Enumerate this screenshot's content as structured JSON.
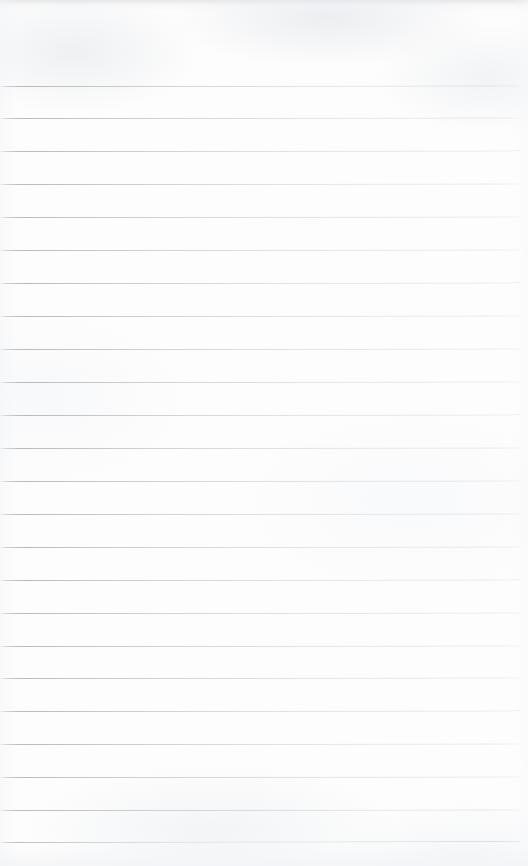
{
  "document": {
    "kind": "blank-ruled-paper-scan",
    "page_width": 528,
    "page_height": 866,
    "page_color": "#fdfdfd",
    "has_text_content": false,
    "has_handwriting": false,
    "has_margin_rule": false,
    "has_header": false,
    "visible_text": ""
  },
  "ruling": {
    "line_color": "#b2b7bd",
    "line_thickness_px": 1,
    "line_count": 24,
    "line_spacing_px": 32.7,
    "first_line_y": 86,
    "last_line_y": 842,
    "line_start_x": 0,
    "line_end_x": 520,
    "right_margin_px": 8,
    "lines": [
      {
        "index": 1,
        "y": 86,
        "x": 0,
        "width": 520,
        "tilt_deg": -0.06
      },
      {
        "index": 2,
        "y": 118,
        "x": 0,
        "width": 520,
        "tilt_deg": -0.05
      },
      {
        "index": 3,
        "y": 151,
        "x": 0,
        "width": 520,
        "tilt_deg": -0.07
      },
      {
        "index": 4,
        "y": 184,
        "x": 0,
        "width": 520,
        "tilt_deg": -0.05
      },
      {
        "index": 5,
        "y": 217,
        "x": 0,
        "width": 520,
        "tilt_deg": -0.06
      },
      {
        "index": 6,
        "y": 250,
        "x": 0,
        "width": 520,
        "tilt_deg": -0.05
      },
      {
        "index": 7,
        "y": 283,
        "x": 0,
        "width": 520,
        "tilt_deg": -0.07
      },
      {
        "index": 8,
        "y": 316,
        "x": 0,
        "width": 520,
        "tilt_deg": -0.05
      },
      {
        "index": 9,
        "y": 349,
        "x": 0,
        "width": 520,
        "tilt_deg": -0.06
      },
      {
        "index": 10,
        "y": 382,
        "x": 0,
        "width": 520,
        "tilt_deg": -0.05
      },
      {
        "index": 11,
        "y": 415,
        "x": 0,
        "width": 520,
        "tilt_deg": -0.07
      },
      {
        "index": 12,
        "y": 448,
        "x": 0,
        "width": 520,
        "tilt_deg": -0.06
      },
      {
        "index": 13,
        "y": 481,
        "x": 0,
        "width": 520,
        "tilt_deg": -0.05
      },
      {
        "index": 14,
        "y": 514,
        "x": 0,
        "width": 520,
        "tilt_deg": -0.06
      },
      {
        "index": 15,
        "y": 547,
        "x": 0,
        "width": 520,
        "tilt_deg": -0.05
      },
      {
        "index": 16,
        "y": 580,
        "x": 0,
        "width": 520,
        "tilt_deg": -0.07
      },
      {
        "index": 17,
        "y": 613,
        "x": 0,
        "width": 520,
        "tilt_deg": -0.05
      },
      {
        "index": 18,
        "y": 646,
        "x": 0,
        "width": 520,
        "tilt_deg": -0.06
      },
      {
        "index": 19,
        "y": 678,
        "x": 0,
        "width": 520,
        "tilt_deg": -0.05
      },
      {
        "index": 20,
        "y": 711,
        "x": 0,
        "width": 520,
        "tilt_deg": -0.07
      },
      {
        "index": 21,
        "y": 744,
        "x": 0,
        "width": 520,
        "tilt_deg": -0.06
      },
      {
        "index": 22,
        "y": 777,
        "x": 0,
        "width": 520,
        "tilt_deg": -0.05
      },
      {
        "index": 23,
        "y": 810,
        "x": 0,
        "width": 520,
        "tilt_deg": -0.06
      },
      {
        "index": 24,
        "y": 842,
        "x": 0,
        "width": 520,
        "tilt_deg": -0.09
      }
    ]
  },
  "scan_artifacts": {
    "top_edge_band_color": "#e4e6ea",
    "top_edge_band_height": 11,
    "bottom_edge_band_color": "#f3f4f7",
    "bottom_edge_band_height": 20,
    "texture": "faint mottled greyish scanner noise"
  }
}
